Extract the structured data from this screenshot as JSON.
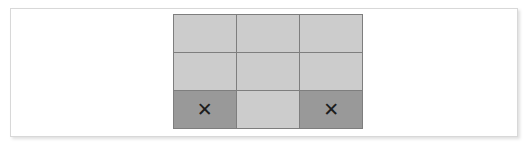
{
  "canvas": {
    "width": 530,
    "height": 145,
    "background": "#ffffff"
  },
  "panel": {
    "background": "#ffffff",
    "border_color": "#d8d8d8",
    "shadow_color": "rgba(0,0,0,0.13)"
  },
  "grid": {
    "rows": 3,
    "columns": 3,
    "line_color": "#7e7e7e",
    "cell_light_color": "#cccccc",
    "cell_dark_color": "#999999",
    "mark_color": "#1d1d1d",
    "mark_glyph": "✕",
    "cells": [
      {
        "row": 0,
        "col": 0,
        "shade": "light",
        "mark": "",
        "name": "grid-cell-r1c1"
      },
      {
        "row": 0,
        "col": 1,
        "shade": "light",
        "mark": "",
        "name": "grid-cell-r1c2"
      },
      {
        "row": 0,
        "col": 2,
        "shade": "light",
        "mark": "",
        "name": "grid-cell-r1c3"
      },
      {
        "row": 1,
        "col": 0,
        "shade": "light",
        "mark": "",
        "name": "grid-cell-r2c1"
      },
      {
        "row": 1,
        "col": 1,
        "shade": "light",
        "mark": "",
        "name": "grid-cell-r2c2"
      },
      {
        "row": 1,
        "col": 2,
        "shade": "light",
        "mark": "",
        "name": "grid-cell-r2c3"
      },
      {
        "row": 2,
        "col": 0,
        "shade": "dark",
        "mark": "✕",
        "name": "grid-cell-r3c1"
      },
      {
        "row": 2,
        "col": 1,
        "shade": "light",
        "mark": "",
        "name": "grid-cell-r3c2"
      },
      {
        "row": 2,
        "col": 2,
        "shade": "dark",
        "mark": "✕",
        "name": "grid-cell-r3c3"
      }
    ]
  }
}
